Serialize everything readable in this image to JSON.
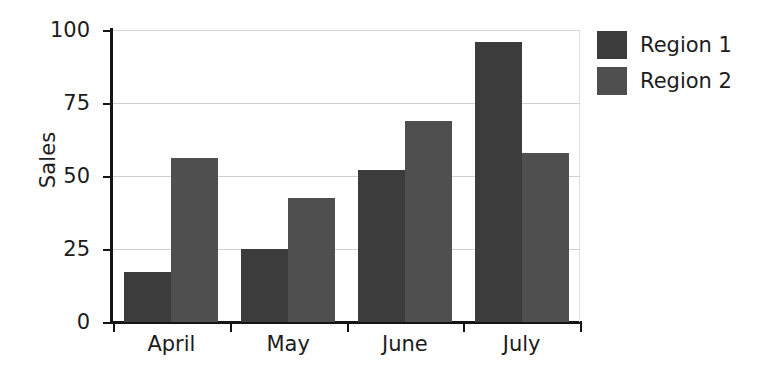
{
  "chart_data": {
    "type": "bar",
    "title": "",
    "xlabel": "",
    "ylabel": "Sales",
    "categories": [
      "April",
      "May",
      "June",
      "July"
    ],
    "series": [
      {
        "name": "Region 1",
        "color": "#3c3c3c",
        "values": [
          17,
          25,
          52,
          96
        ]
      },
      {
        "name": "Region 2",
        "color": "#4f4f4f",
        "values": [
          56,
          42.5,
          69,
          58
        ]
      }
    ],
    "ylim": [
      0,
      100
    ],
    "yticks": [
      0,
      25,
      50,
      75,
      100
    ],
    "ytick_labels": [
      "0",
      "25",
      "50",
      "75",
      "100"
    ],
    "grid": true,
    "grid_axis": "y",
    "legend_position": "right",
    "background_color": "#ffffff",
    "axis_color": "#151515",
    "grid_color": "#cfcfcf"
  }
}
